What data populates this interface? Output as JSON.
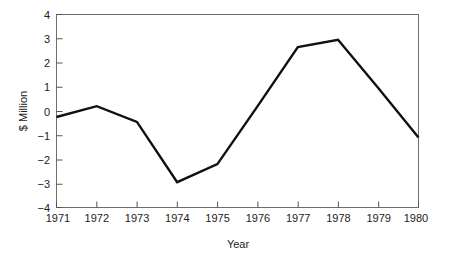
{
  "chart_data": {
    "type": "line",
    "title": "",
    "xlabel": "Year",
    "ylabel": "$ Million",
    "x": [
      1971,
      1972,
      1973,
      1974,
      1975,
      1976,
      1977,
      1978,
      1979,
      1980
    ],
    "categories": [
      "1971",
      "1972",
      "1973",
      "1974",
      "1975",
      "1976",
      "1977",
      "1978",
      "1979",
      "1980"
    ],
    "values": [
      -0.25,
      0.2,
      -0.45,
      -2.95,
      -2.2,
      0.2,
      2.65,
      2.95,
      0.95,
      -1.1
    ],
    "series": [
      {
        "name": "$ Million",
        "values": [
          -0.25,
          0.2,
          -0.45,
          -2.95,
          -2.2,
          0.2,
          2.65,
          2.95,
          0.95,
          -1.1
        ]
      }
    ],
    "xlim": [
      1971,
      1980
    ],
    "ylim": [
      -4,
      4
    ],
    "yticks": [
      4,
      3,
      2,
      1,
      0,
      -1,
      -2,
      -3,
      -4
    ],
    "ytick_labels": [
      "4",
      "3",
      "2",
      "1",
      "0",
      "−1",
      "−2",
      "−3",
      "−4"
    ],
    "xticks": [
      1971,
      1972,
      1973,
      1974,
      1975,
      1976,
      1977,
      1978,
      1979,
      1980
    ],
    "xtick_labels": [
      "1971",
      "1972",
      "1973",
      "1974",
      "1975",
      "1976",
      "1977",
      "1978",
      "1979",
      "1980"
    ],
    "grid": false,
    "legend": false,
    "legend_position": "none",
    "line_color": "#101010",
    "frame_color": "#6e6e6e",
    "background_color": "#ffffff"
  }
}
